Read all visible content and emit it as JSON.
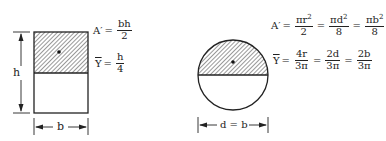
{
  "rectangle": {
    "height_label": "h",
    "width_label": "b",
    "area": {
      "lhs": "A′",
      "eq": "=",
      "num": "bh",
      "den": "2"
    },
    "centroid": {
      "lhs": "Y",
      "eq": "=",
      "num": "h",
      "den": "4"
    }
  },
  "circle": {
    "diameter_label": "d = b",
    "area": {
      "lhs": "A′",
      "eq": "=",
      "terms": [
        {
          "num": "πr",
          "sup": "2",
          "den": "2"
        },
        {
          "num": "πd",
          "sup": "2",
          "den": "8"
        },
        {
          "num": "πb",
          "sup": "2",
          "den": "8"
        }
      ]
    },
    "centroid": {
      "lhs": "Y",
      "eq": "=",
      "terms": [
        {
          "num": "4r",
          "den": "3π"
        },
        {
          "num": "2d",
          "den": "3π"
        },
        {
          "num": "2b",
          "den": "3π"
        }
      ]
    }
  },
  "colors": {
    "stroke": "#222222",
    "background": "#ffffff"
  }
}
